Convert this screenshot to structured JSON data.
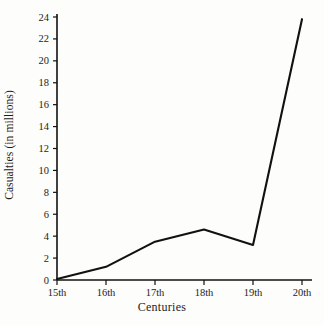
{
  "chart_data": {
    "type": "line",
    "title": "",
    "xlabel": "Centuries",
    "ylabel": "Casualties (in millions)",
    "categories": [
      "15th",
      "16th",
      "17th",
      "18th",
      "19th",
      "20th"
    ],
    "values": [
      0.1,
      1.2,
      3.5,
      4.6,
      3.2,
      23.8
    ],
    "series": [
      {
        "name": "Casualties",
        "values": [
          0.1,
          1.2,
          3.5,
          4.6,
          3.2,
          23.8
        ],
        "color": "#111111"
      }
    ],
    "ylim": [
      0,
      24
    ],
    "ytick_values": [
      0,
      2,
      4,
      6,
      8,
      10,
      12,
      14,
      16,
      18,
      20,
      22,
      24
    ],
    "ytick_labels": [
      "0",
      "2",
      "4",
      "6",
      "8",
      "10",
      "12",
      "14",
      "16",
      "18",
      "20",
      "22",
      "24"
    ],
    "xtick_labels": [
      "15th",
      "16th",
      "17th",
      "18th",
      "19th",
      "20th"
    ],
    "grid": false,
    "legend": false,
    "legend_position": "none",
    "annotations": []
  },
  "colors": {
    "line": "#111111",
    "axis": "#111111",
    "text": "#1c1c1c",
    "background": "#fdfdfb"
  }
}
